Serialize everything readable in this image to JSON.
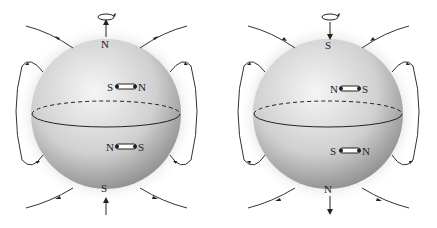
{
  "diagram": {
    "panels": [
      {
        "id": "left",
        "top_pole": "N",
        "bottom_pole": "S",
        "upper_compass": {
          "left": "S",
          "right": "N"
        },
        "lower_compass": {
          "left": "N",
          "right": "S"
        },
        "field_direction": "outward at top, inward at bottom"
      },
      {
        "id": "right",
        "top_pole": "S",
        "bottom_pole": "N",
        "upper_compass": {
          "left": "N",
          "right": "S"
        },
        "lower_compass": {
          "left": "S",
          "right": "N"
        },
        "field_direction": "inward at top, outward at bottom"
      }
    ],
    "colors": {
      "sphere_light": "#f2f2f2",
      "sphere_dark": "#8a8a8a",
      "line": "#333333"
    }
  }
}
